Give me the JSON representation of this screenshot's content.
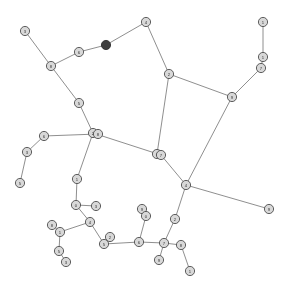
{
  "figure": {
    "kind": "network-graph",
    "width": 286,
    "height": 296,
    "background_color": "#ffffff",
    "edge_color": "#6e6e6e",
    "node_fill_color": "#d9d9d9",
    "node_stroke_color": "#4a4a4a",
    "highlight_node_color": "#3a3a3a",
    "node_radius": 4.6
  },
  "chart_data": {
    "type": "scatter",
    "title": "",
    "xlabel": "",
    "ylabel": "",
    "grid": false,
    "legend": "none",
    "xlim": [
      0,
      286
    ],
    "ylim": [
      0,
      296
    ],
    "nodes": [
      {
        "id": "n1",
        "label": "3",
        "x": 25,
        "y": 31,
        "highlight": false
      },
      {
        "id": "n2",
        "label": "8",
        "x": 51,
        "y": 66,
        "highlight": false
      },
      {
        "id": "n3",
        "label": "6",
        "x": 79,
        "y": 52,
        "highlight": false
      },
      {
        "id": "n4",
        "label": "0",
        "x": 106,
        "y": 45,
        "highlight": true
      },
      {
        "id": "n5",
        "label": "4",
        "x": 146,
        "y": 22,
        "highlight": false
      },
      {
        "id": "n6",
        "label": "2",
        "x": 169,
        "y": 74,
        "highlight": false
      },
      {
        "id": "n7",
        "label": "1",
        "x": 263,
        "y": 22,
        "highlight": false
      },
      {
        "id": "n8",
        "label": "1",
        "x": 263,
        "y": 57,
        "highlight": false
      },
      {
        "id": "n9",
        "label": "7",
        "x": 261,
        "y": 68,
        "highlight": false
      },
      {
        "id": "n10",
        "label": "9",
        "x": 232,
        "y": 97,
        "highlight": false
      },
      {
        "id": "n11",
        "label": "5",
        "x": 79,
        "y": 103,
        "highlight": false
      },
      {
        "id": "n12",
        "label": "2",
        "x": 93,
        "y": 133,
        "highlight": false
      },
      {
        "id": "n13",
        "label": "8",
        "x": 98,
        "y": 134,
        "highlight": false
      },
      {
        "id": "n14",
        "label": "6",
        "x": 44,
        "y": 136,
        "highlight": false
      },
      {
        "id": "n15",
        "label": "3",
        "x": 27,
        "y": 152,
        "highlight": false
      },
      {
        "id": "n16",
        "label": "5",
        "x": 20,
        "y": 183,
        "highlight": false
      },
      {
        "id": "n17",
        "label": "1",
        "x": 77,
        "y": 179,
        "highlight": false
      },
      {
        "id": "n18",
        "label": "6",
        "x": 157,
        "y": 154,
        "highlight": false
      },
      {
        "id": "n19",
        "label": "7",
        "x": 161,
        "y": 155,
        "highlight": false
      },
      {
        "id": "n20",
        "label": "4",
        "x": 186,
        "y": 185,
        "highlight": false
      },
      {
        "id": "n21",
        "label": "9",
        "x": 269,
        "y": 209,
        "highlight": false
      },
      {
        "id": "n22",
        "label": "2",
        "x": 175,
        "y": 219,
        "highlight": false
      },
      {
        "id": "n23",
        "label": "0",
        "x": 76,
        "y": 205,
        "highlight": false
      },
      {
        "id": "n24",
        "label": "3",
        "x": 96,
        "y": 206,
        "highlight": false
      },
      {
        "id": "n25",
        "label": "4",
        "x": 90,
        "y": 222,
        "highlight": false
      },
      {
        "id": "n26",
        "label": "8",
        "x": 52,
        "y": 225,
        "highlight": false
      },
      {
        "id": "n27",
        "label": "1",
        "x": 60,
        "y": 232,
        "highlight": false
      },
      {
        "id": "n28",
        "label": "5",
        "x": 59,
        "y": 251,
        "highlight": false
      },
      {
        "id": "n29",
        "label": "3",
        "x": 66,
        "y": 262,
        "highlight": false
      },
      {
        "id": "n30",
        "label": "2",
        "x": 110,
        "y": 237,
        "highlight": false
      },
      {
        "id": "n31",
        "label": "5",
        "x": 104,
        "y": 244,
        "highlight": false
      },
      {
        "id": "n32",
        "label": "6",
        "x": 139,
        "y": 242,
        "highlight": false
      },
      {
        "id": "n33",
        "label": "9",
        "x": 142,
        "y": 209,
        "highlight": false
      },
      {
        "id": "n34",
        "label": "0",
        "x": 146,
        "y": 216,
        "highlight": false
      },
      {
        "id": "n35",
        "label": "7",
        "x": 164,
        "y": 243,
        "highlight": false
      },
      {
        "id": "n36",
        "label": "8",
        "x": 181,
        "y": 245,
        "highlight": false
      },
      {
        "id": "n37",
        "label": "9",
        "x": 159,
        "y": 260,
        "highlight": false
      },
      {
        "id": "n38",
        "label": "1",
        "x": 190,
        "y": 271,
        "highlight": false
      }
    ],
    "edges": [
      [
        "n1",
        "n2"
      ],
      [
        "n2",
        "n3"
      ],
      [
        "n3",
        "n4"
      ],
      [
        "n4",
        "n5"
      ],
      [
        "n5",
        "n6"
      ],
      [
        "n6",
        "n10"
      ],
      [
        "n6",
        "n18"
      ],
      [
        "n7",
        "n8"
      ],
      [
        "n8",
        "n9"
      ],
      [
        "n9",
        "n10"
      ],
      [
        "n10",
        "n20"
      ],
      [
        "n2",
        "n11"
      ],
      [
        "n11",
        "n12"
      ],
      [
        "n12",
        "n13"
      ],
      [
        "n13",
        "n14"
      ],
      [
        "n14",
        "n15"
      ],
      [
        "n15",
        "n16"
      ],
      [
        "n12",
        "n17"
      ],
      [
        "n12",
        "n19"
      ],
      [
        "n19",
        "n20"
      ],
      [
        "n20",
        "n21"
      ],
      [
        "n20",
        "n22"
      ],
      [
        "n17",
        "n23"
      ],
      [
        "n23",
        "n24"
      ],
      [
        "n23",
        "n25"
      ],
      [
        "n25",
        "n27"
      ],
      [
        "n26",
        "n27"
      ],
      [
        "n27",
        "n28"
      ],
      [
        "n28",
        "n29"
      ],
      [
        "n25",
        "n31"
      ],
      [
        "n30",
        "n31"
      ],
      [
        "n31",
        "n32"
      ],
      [
        "n32",
        "n34"
      ],
      [
        "n33",
        "n34"
      ],
      [
        "n32",
        "n35"
      ],
      [
        "n22",
        "n35"
      ],
      [
        "n35",
        "n36"
      ],
      [
        "n35",
        "n37"
      ],
      [
        "n36",
        "n38"
      ]
    ]
  }
}
